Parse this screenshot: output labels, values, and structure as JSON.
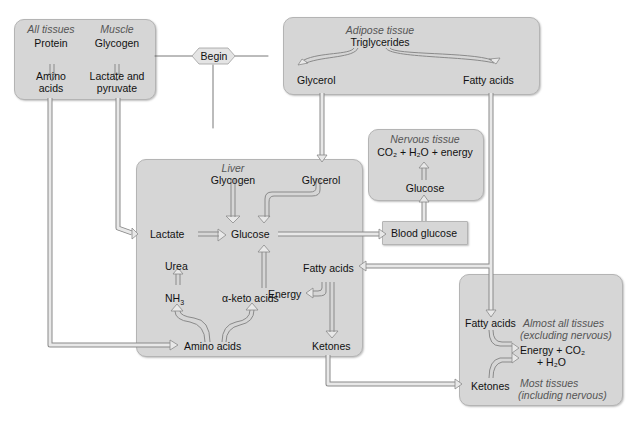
{
  "begin": "Begin",
  "all_tissues": {
    "heading": "All tissues",
    "source": "Protein",
    "product_line1": "Amino",
    "product_line2": "acids"
  },
  "muscle": {
    "heading": "Muscle",
    "source": "Glycogen",
    "product_line1": "Lactate and",
    "product_line2": "pyruvate"
  },
  "adipose": {
    "heading": "Adipose tissue",
    "source": "Triglycerides",
    "left": "Glycerol",
    "right": "Fatty acids"
  },
  "liver": {
    "heading": "Liver",
    "glycogen": "Glycogen",
    "glycerol": "Glycerol",
    "lactate": "Lactate",
    "glucose": "Glucose",
    "urea": "Urea",
    "nh3": "NH",
    "nh3_sub": "3",
    "keto": "α-keto acids",
    "fatty_acids": "Fatty acids",
    "energy": "Energy",
    "amino_acids": "Amino acids",
    "ketones": "Ketones"
  },
  "nervous": {
    "heading": "Nervous tissue",
    "products": "CO₂ + H₂O + energy",
    "glucose": "Glucose"
  },
  "blood_glucose": "Blood glucose",
  "peripheral": {
    "fatty_acids": "Fatty acids",
    "almost_all_1": "Almost all tissues",
    "almost_all_2": "(excluding nervous)",
    "products_1": "Energy + CO₂",
    "products_2": "+ H₂O",
    "ketones": "Ketones",
    "most_1": "Most tissues",
    "most_2": "(including nervous)"
  },
  "colors": {
    "box_fill": "#d6d6d6",
    "box_border": "#b4b4b4",
    "arrow_fill": "#e8e8e8",
    "arrow_stroke": "#8a8a8a",
    "italic_text": "#555555"
  }
}
